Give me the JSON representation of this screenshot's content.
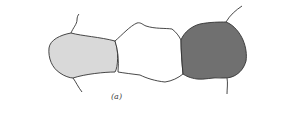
{
  "figure": {
    "label": "(a)",
    "cells": [
      {
        "name": "left-cell",
        "fill": "#d9d9d9"
      },
      {
        "name": "middle-cell",
        "fill": "#ffffff"
      },
      {
        "name": "right-cell",
        "fill": "#707070"
      }
    ],
    "stroke": "#333333"
  }
}
